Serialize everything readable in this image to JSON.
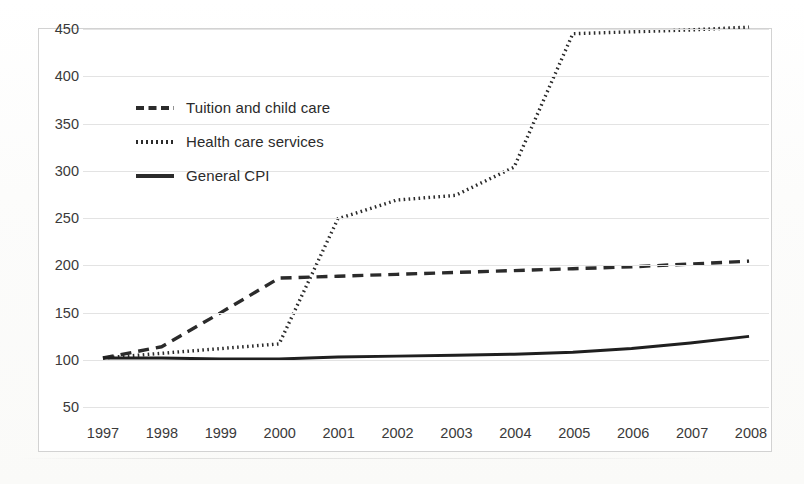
{
  "chart_data": {
    "type": "line",
    "title": "",
    "xlabel": "",
    "ylabel": "",
    "x": [
      1997,
      1998,
      1999,
      2000,
      2001,
      2002,
      2003,
      2004,
      2005,
      2006,
      2007,
      2008
    ],
    "categories": [
      "1997",
      "1998",
      "1999",
      "2000",
      "2001",
      "2002",
      "2003",
      "2004",
      "2005",
      "2006",
      "2007",
      "2008"
    ],
    "ylim": [
      50,
      450
    ],
    "yticks": [
      50,
      100,
      150,
      200,
      250,
      300,
      350,
      400,
      450
    ],
    "ytick_labels": [
      "50",
      "100",
      "150",
      "200",
      "250",
      "300",
      "350",
      "400",
      "450"
    ],
    "grid": "horizontal",
    "legend_position": "upper-left-inside",
    "series": [
      {
        "name": "Tuition and child care",
        "style": "dashed",
        "color": "#2b2b2b",
        "values": [
          100,
          112,
          148,
          185,
          187,
          189,
          191,
          193,
          195,
          197,
          200,
          203
        ]
      },
      {
        "name": "Health care services",
        "style": "dotted",
        "color": "#2b2b2b",
        "values": [
          100,
          105,
          110,
          115,
          248,
          268,
          273,
          303,
          445,
          447,
          449,
          452
        ]
      },
      {
        "name": "General CPI",
        "style": "solid",
        "color": "#1f1f1f",
        "values": [
          100,
          100,
          99,
          99,
          101,
          102,
          103,
          104,
          106,
          110,
          116,
          123
        ]
      }
    ]
  },
  "legend": {
    "items": [
      {
        "label": "Tuition and child care",
        "style": "dashed"
      },
      {
        "label": "Health care services",
        "style": "dotted"
      },
      {
        "label": "General CPI",
        "style": "solid"
      }
    ]
  },
  "axes": {
    "y_tick_labels": [
      "450",
      "400",
      "350",
      "300",
      "250",
      "200",
      "150",
      "100",
      "50"
    ],
    "x_tick_labels": [
      "1997",
      "1998",
      "1999",
      "2000",
      "2001",
      "2002",
      "2003",
      "2004",
      "2005",
      "2006",
      "2007",
      "2008"
    ]
  },
  "colors": {
    "grid": "#e3e3e3",
    "border": "#d2d2d2",
    "ink": "#2b2b2b",
    "page": "#fdfdfc"
  }
}
